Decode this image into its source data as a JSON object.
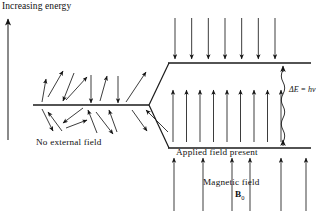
{
  "figure": {
    "title_axis_label": "Increasing energy",
    "left_state_label": "No external field",
    "right_state_label": "Applied field present",
    "field_label": "Magnetic field",
    "field_symbol": "B",
    "field_symbol_sub": "0",
    "energy_gap_label": "ΔE = hν"
  },
  "chart_data": {
    "type": "diagram",
    "stroke_color": "#1a1a1a",
    "background": "#ffffff",
    "energy_axis": {
      "label": "Increasing energy",
      "x": 8,
      "y_top": 18,
      "y_bottom": 140,
      "direction": "up"
    },
    "levels": [
      {
        "name": "degenerate-level",
        "x1": 33,
        "x2": 148,
        "y": 105,
        "label": "No external field",
        "arrow_count": 20,
        "arrow_orientation": "random"
      },
      {
        "name": "upper-level-beta",
        "x1": 168,
        "x2": 310,
        "y": 63,
        "label": "",
        "arrow_count": 7,
        "arrow_orientation": "down"
      },
      {
        "name": "lower-level-alpha",
        "x1": 168,
        "x2": 310,
        "y": 148,
        "label": "Applied field present",
        "arrow_count": 9,
        "arrow_orientation": "up"
      }
    ],
    "split_lines": [
      {
        "from": [
          149,
          105
        ],
        "to": [
          170,
          63
        ]
      },
      {
        "from": [
          149,
          105
        ],
        "to": [
          170,
          148
        ]
      }
    ],
    "transition": {
      "name": "photon-wavy-line",
      "x": 283,
      "y_from": 142,
      "y_to": 66,
      "label": "ΔE = hν"
    },
    "applied_field_arrows": {
      "count": 6,
      "direction": "up",
      "xs": [
        174,
        203,
        232,
        250,
        281,
        306
      ],
      "y_top": 158,
      "y_bottom": 211
    },
    "random_arrows_above": [
      {
        "x1": 42,
        "y1": 102,
        "x2": 46,
        "y2": 79
      },
      {
        "x1": 48,
        "y1": 97,
        "x2": 63,
        "y2": 71
      },
      {
        "x1": 66,
        "y1": 100,
        "x2": 87,
        "y2": 77
      },
      {
        "x1": 74,
        "y1": 73,
        "x2": 63,
        "y2": 101
      },
      {
        "x1": 91,
        "y1": 75,
        "x2": 91,
        "y2": 103
      },
      {
        "x1": 100,
        "y1": 101,
        "x2": 107,
        "y2": 76
      },
      {
        "x1": 118,
        "y1": 76,
        "x2": 118,
        "y2": 103
      },
      {
        "x1": 126,
        "y1": 102,
        "x2": 146,
        "y2": 72
      }
    ],
    "random_arrows_below": [
      {
        "x1": 42,
        "y1": 109,
        "x2": 53,
        "y2": 131
      },
      {
        "x1": 62,
        "y1": 131,
        "x2": 48,
        "y2": 112
      },
      {
        "x1": 83,
        "y1": 108,
        "x2": 63,
        "y2": 123
      },
      {
        "x1": 66,
        "y1": 128,
        "x2": 87,
        "y2": 120
      },
      {
        "x1": 97,
        "y1": 133,
        "x2": 88,
        "y2": 110
      },
      {
        "x1": 96,
        "y1": 112,
        "x2": 113,
        "y2": 134
      },
      {
        "x1": 117,
        "y1": 132,
        "x2": 109,
        "y2": 110
      },
      {
        "x1": 132,
        "y1": 110,
        "x2": 147,
        "y2": 131
      },
      {
        "x1": 168,
        "y1": 132,
        "x2": 146,
        "y2": 110
      }
    ]
  }
}
